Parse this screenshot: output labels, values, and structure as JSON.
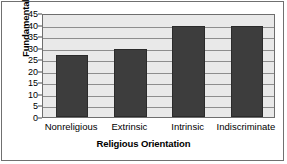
{
  "chart_data": {
    "type": "bar",
    "title": "",
    "xlabel": "Religious Orientation",
    "ylabel": "Fundamentalism",
    "categories": [
      "Nonreligious",
      "Extrinsic",
      "Intrinsic",
      "Indiscriminate"
    ],
    "values": [
      27,
      29.5,
      39.5,
      39.5
    ],
    "ylim": [
      0,
      45
    ],
    "ytick_labels": [
      "0",
      "5",
      "10",
      "15",
      "20",
      "25",
      "30",
      "35",
      "40",
      "45"
    ],
    "ytick_values": [
      0,
      5,
      10,
      15,
      20,
      25,
      30,
      35,
      40,
      45
    ],
    "grid": true,
    "legend": false,
    "bar_color": "#3d3d3d",
    "plot_background": "#e9e9e9",
    "gridline_color": "#8d8d8d",
    "axis_color": "#6e6e6e",
    "figure_background": "#ffffff"
  }
}
